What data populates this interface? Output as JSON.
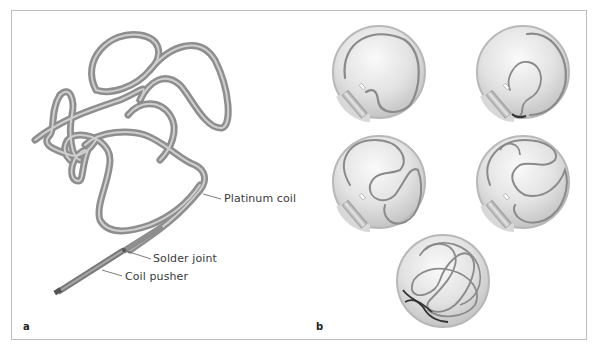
{
  "figure": {
    "panels": [
      {
        "id": "a",
        "letter": "a",
        "description": "Detachable platinum coil with solder joint and coil pusher",
        "labels": {
          "platinum_coil": "Platinum coil",
          "solder_joint": "Solder joint",
          "coil_pusher": "Coil pusher"
        }
      },
      {
        "id": "b",
        "letter": "b",
        "description": "Sequential coil deployment into a spherical aneurysm via catheter",
        "steps": [
          {
            "step": 1,
            "label": "coil-entering-aneurysm"
          },
          {
            "step": 2,
            "label": "coil-forming-first-loop"
          },
          {
            "step": 3,
            "label": "coil-filling-sac"
          },
          {
            "step": 4,
            "label": "coil-framing-complete"
          },
          {
            "step": 5,
            "label": "coil-detached-dense-packing"
          }
        ]
      }
    ],
    "colors": {
      "frame": "#bdbdbd",
      "coil_outer": "#8e8e8e",
      "coil_inner": "#c9c9c9",
      "coil_dark": "#444444",
      "sphere_light": "#f4f4f4",
      "sphere_dark": "#c8c8c8",
      "text": "#3a3a3a"
    }
  }
}
